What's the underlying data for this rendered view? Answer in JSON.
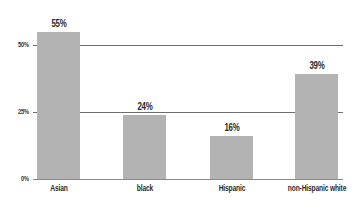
{
  "chart_data": {
    "type": "bar",
    "title": "",
    "xlabel": "",
    "ylabel": "",
    "categories": [
      "Asian",
      "black",
      "Hispanic",
      "non-Hispanic white"
    ],
    "values": [
      55,
      24,
      16,
      39
    ],
    "value_labels": [
      "55%",
      "24%",
      "16%",
      "39%"
    ],
    "yticks": [
      0,
      25,
      50
    ],
    "ytick_labels": [
      "0%",
      "25%",
      "50%"
    ],
    "ylim": [
      0,
      60
    ],
    "grid": true,
    "legend": null,
    "colors": {
      "bar": "#b3b3b3",
      "grid": "#6e6e6e",
      "text": "#2a2a2a"
    }
  }
}
